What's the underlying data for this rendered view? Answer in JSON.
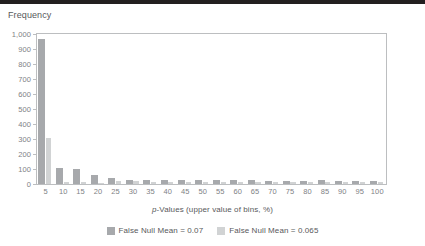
{
  "title": "Frequency",
  "top_rule_color": "#231f20",
  "chart_data": {
    "type": "bar",
    "title": "Frequency",
    "xlabel": "p-Values (upper value of bins, %)",
    "ylabel": "Frequency",
    "xlabel_italic_prefix": "p",
    "xlabel_rest": "-Values (upper value of bins, %)",
    "grid": false,
    "legend_position": "bottom-center",
    "ylim": [
      0,
      1000
    ],
    "ytick_labels": [
      "1,000",
      "900",
      "800",
      "700",
      "600",
      "500",
      "400",
      "300",
      "200",
      "100",
      "0"
    ],
    "ytick_values": [
      1000,
      900,
      800,
      700,
      600,
      500,
      400,
      300,
      200,
      100,
      0
    ],
    "categories": [
      "5",
      "10",
      "15",
      "20",
      "25",
      "30",
      "35",
      "40",
      "45",
      "50",
      "55",
      "60",
      "65",
      "70",
      "75",
      "80",
      "85",
      "90",
      "95",
      "100"
    ],
    "series": [
      {
        "name": "False Null Mean = 0.07",
        "color": "#a7a9ac",
        "values": [
          965,
          110,
          100,
          60,
          38,
          30,
          28,
          26,
          25,
          25,
          24,
          24,
          30,
          22,
          22,
          22,
          30,
          22,
          22,
          22
        ]
      },
      {
        "name": "False Null Mean = 0.065",
        "color": "#d1d3d4",
        "values": [
          305,
          12,
          12,
          10,
          22,
          18,
          16,
          16,
          15,
          15,
          14,
          14,
          16,
          14,
          14,
          14,
          16,
          14,
          14,
          14
        ]
      }
    ]
  },
  "legend": {
    "items": [
      {
        "label": "False Null Mean = 0.07",
        "color": "#a7a9ac"
      },
      {
        "label": "False Null Mean = 0.065",
        "color": "#d1d3d4"
      }
    ]
  }
}
